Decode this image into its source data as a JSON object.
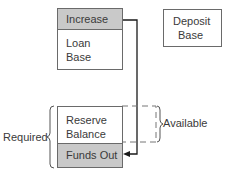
{
  "diagram": {
    "boxes": {
      "increase": "Increase",
      "loan_base_line1": "Loan",
      "loan_base_line2": "Base",
      "deposit_base_line1": "Deposit",
      "deposit_base_line2": "Base",
      "reserve_balance_line1": "Reserve",
      "reserve_balance_line2": "Balance",
      "funds_out": "Funds Out"
    },
    "labels": {
      "required": "Required",
      "available": "Available"
    },
    "colors": {
      "shaded_fill": "#c9c9c9",
      "border": "#6a6a6a",
      "arrow": "#1a1a1a",
      "text": "#3a3a3a"
    }
  }
}
